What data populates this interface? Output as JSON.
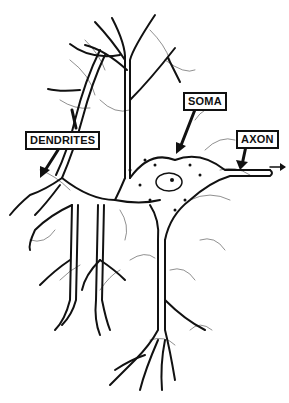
{
  "diagram": {
    "type": "neuron-illustration",
    "style": "black ink line drawing on white",
    "colors": {
      "ink": "#111111",
      "background": "#ffffff"
    },
    "labels": [
      {
        "id": "dendrites",
        "text": "DENDRITES",
        "x": 25,
        "y": 131,
        "points_to": "dendrite branches (lower left)"
      },
      {
        "id": "soma",
        "text": "SOMA",
        "x": 183,
        "y": 92,
        "points_to": "cell body"
      },
      {
        "id": "axon",
        "text": "AXON",
        "x": 236,
        "y": 130,
        "points_to": "axon process (right)"
      }
    ],
    "annotations": {
      "signal_direction_arrow": "right-pointing arrow beyond axon tip",
      "nucleus": "oval nucleus with nucleolus in center of soma"
    }
  }
}
